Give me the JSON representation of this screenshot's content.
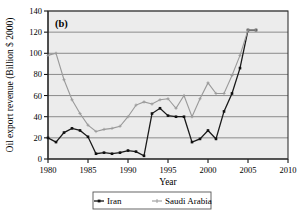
{
  "chart_data": {
    "type": "line",
    "title": "",
    "panel_label": "(b)",
    "xlabel": "Year",
    "ylabel": "Oil export revenue (Billion $ 2000)",
    "xlim": [
      1980,
      2010
    ],
    "ylim": [
      0,
      140
    ],
    "xticks": [
      1980,
      1985,
      1990,
      1995,
      2000,
      2005,
      2010
    ],
    "yticks": [
      0,
      20,
      40,
      60,
      80,
      100,
      120,
      140
    ],
    "grid": "horizontal",
    "legend_position": "below-axes",
    "x": [
      1980,
      1981,
      1982,
      1983,
      1984,
      1985,
      1986,
      1987,
      1988,
      1989,
      1990,
      1991,
      1992,
      1993,
      1994,
      1995,
      1996,
      1997,
      1998,
      1999,
      2000,
      2001,
      2002,
      2003,
      2004,
      2005,
      2006
    ],
    "series": [
      {
        "name": "Iran",
        "marker": "filled-square",
        "color": "#111111",
        "values": [
          20,
          16,
          25,
          29,
          27,
          21,
          5,
          6,
          5,
          6,
          8,
          7,
          3,
          43,
          48,
          41,
          40,
          40,
          16,
          19,
          27,
          19,
          45,
          62,
          86,
          122,
          122
        ]
      },
      {
        "name": "Saudi Arabia",
        "marker": "plus",
        "color": "#9a9a9a",
        "values": [
          98,
          100,
          75,
          56,
          43,
          32,
          26,
          28,
          29,
          31,
          40,
          51,
          54,
          52,
          56,
          57,
          48,
          60,
          40,
          57,
          72,
          62,
          62,
          79,
          98,
          122,
          122
        ]
      }
    ]
  },
  "legend": {
    "entries": [
      {
        "label": "Iran"
      },
      {
        "label": "Saudi Arabia"
      }
    ]
  },
  "axes": {
    "y_tick_labels": [
      "0",
      "20",
      "40",
      "60",
      "80",
      "100",
      "120",
      "140"
    ],
    "x_tick_labels": [
      "1980",
      "1985",
      "1990",
      "1995",
      "2000",
      "2005",
      "2010"
    ]
  }
}
